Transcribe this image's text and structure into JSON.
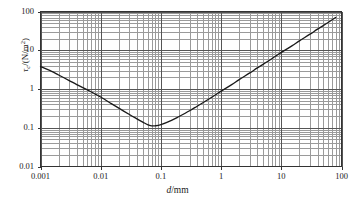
{
  "chart_data": {
    "type": "line",
    "title": "",
    "subtitle": "",
    "xlabel": "d/mm",
    "xlabel_parts": {
      "symbol": "d",
      "unit": "/mm"
    },
    "ylabel": "τc/(N/m2)",
    "ylabel_parts": {
      "symbol": "τ",
      "subscript": "c",
      "unit": "/(N/m",
      "superscript": "2",
      "unit_end": ")"
    },
    "xscale": "log",
    "yscale": "log",
    "xlim": [
      0.001,
      100
    ],
    "ylim": [
      0.01,
      100
    ],
    "grid": "major and minor, both axes",
    "legend": "none",
    "xtick_labels": [
      "0.001",
      "0.01",
      "0.1",
      "1",
      "10",
      "100"
    ],
    "xtick_values": [
      0.001,
      0.01,
      0.1,
      1,
      10,
      100
    ],
    "ytick_labels": [
      "0.01",
      "0.1",
      "1",
      "10",
      "100"
    ],
    "ytick_values": [
      0.01,
      0.1,
      1,
      10,
      100
    ],
    "series": [
      {
        "name": "critical shear stress",
        "color": "#1a1a1a",
        "linewidth": 1.3,
        "x": [
          0.001,
          0.0015,
          0.002,
          0.003,
          0.004,
          0.006,
          0.008,
          0.01,
          0.015,
          0.02,
          0.03,
          0.04,
          0.05,
          0.06,
          0.07,
          0.08,
          0.1,
          0.15,
          0.2,
          0.3,
          0.4,
          0.6,
          0.8,
          1.0,
          1.5,
          2.0,
          3.0,
          4.0,
          6.0,
          8.0,
          10.0,
          15.0,
          20.0,
          30.0,
          40.0,
          60.0,
          80.0
        ],
        "y": [
          3.8,
          2.9,
          2.3,
          1.65,
          1.3,
          0.95,
          0.75,
          0.62,
          0.42,
          0.32,
          0.22,
          0.17,
          0.14,
          0.12,
          0.112,
          0.112,
          0.12,
          0.155,
          0.195,
          0.275,
          0.36,
          0.53,
          0.7,
          0.88,
          1.3,
          1.75,
          2.6,
          3.5,
          5.2,
          7.0,
          8.8,
          13.0,
          17.5,
          26.0,
          35.0,
          52.0,
          70.0
        ]
      }
    ],
    "annotations": [
      {
        "text": "minimum of curve",
        "x": 0.07,
        "y": 0.11
      }
    ],
    "axis_colors": {
      "frame": "#333333",
      "major_gridline": "#555555",
      "minor_gridline": "#9a9a9a",
      "background": "#ffffff"
    }
  },
  "figure": {
    "name": "critical-shear-stress-chart"
  }
}
